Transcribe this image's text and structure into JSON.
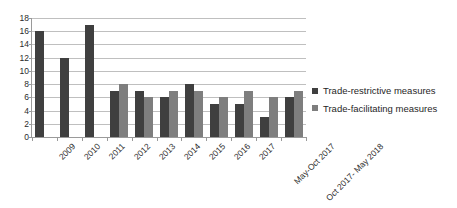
{
  "chart_data": {
    "type": "bar",
    "title": "",
    "subtitle": "",
    "xlabel": "",
    "ylabel": "",
    "ylim": [
      0,
      18
    ],
    "ytick_step": 2,
    "yticks": [
      18,
      16,
      14,
      12,
      10,
      8,
      6,
      4,
      2,
      0
    ],
    "grid": true,
    "legend_position": "right",
    "categories": [
      "2009",
      "2010",
      "2011",
      "2012",
      "2013",
      "2014",
      "2015",
      "2016",
      "2017",
      "May-Oct 2017",
      "Oct 2017- May 2018"
    ],
    "series": [
      {
        "name": "Trade-restrictive measures",
        "color": "#3f3f3f",
        "values": [
          16,
          12,
          17,
          7,
          7,
          6,
          8,
          5,
          5,
          3,
          6
        ]
      },
      {
        "name": "Trade-facilitating measures",
        "color": "#7e7e7e",
        "values": [
          null,
          null,
          null,
          8,
          6,
          7,
          7,
          6,
          7,
          6,
          7
        ]
      }
    ]
  },
  "legend": {
    "items": [
      {
        "label": "Trade-restrictive measures",
        "color": "#3f3f3f"
      },
      {
        "label": "Trade-facilitating measures",
        "color": "#7e7e7e"
      }
    ]
  },
  "colors": {
    "restrictive": "#3f3f3f",
    "facilitating": "#7e7e7e",
    "gridline": "#bfbfbf",
    "axis": "#9a9a9a",
    "text": "#2b2b2b",
    "background": "#ffffff"
  }
}
